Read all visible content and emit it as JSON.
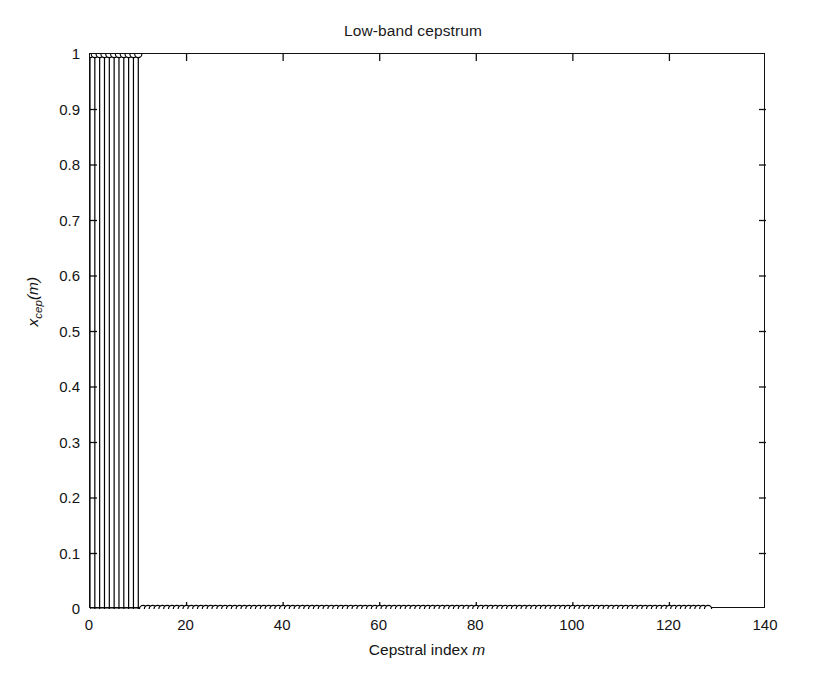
{
  "chart_data": {
    "type": "bar",
    "plot_style": "stem",
    "title": "Low-band cepstrum",
    "xlabel": "Cepstral index m",
    "xlabel_plain": "Cepstral index",
    "xlabel_italic_var": "m",
    "ylabel": "x_cep(m)",
    "ylabel_base": "x",
    "ylabel_sub": "cep",
    "ylabel_tail": "(m)",
    "xlim": [
      0,
      140
    ],
    "ylim": [
      0,
      1
    ],
    "grid": false,
    "legend": null,
    "xticks": [
      0,
      20,
      40,
      60,
      80,
      100,
      120,
      140
    ],
    "xticklabels": [
      "0",
      "20",
      "40",
      "60",
      "80",
      "100",
      "120",
      "140"
    ],
    "yticks": [
      0,
      0.1,
      0.2,
      0.3,
      0.4,
      0.5,
      0.6,
      0.7,
      0.8,
      0.9,
      1
    ],
    "yticklabels": [
      "0",
      "0.1",
      "0.2",
      "0.3",
      "0.4",
      "0.5",
      "0.6",
      "0.7",
      "0.8",
      "0.9",
      "1"
    ],
    "marker": "circle-open",
    "line_color": "#000000",
    "series_name": "low-band lifter",
    "x": [
      0,
      1,
      2,
      3,
      4,
      5,
      6,
      7,
      8,
      9,
      10,
      11,
      12,
      13,
      14,
      15,
      16,
      17,
      18,
      19,
      20,
      21,
      22,
      23,
      24,
      25,
      26,
      27,
      28,
      29,
      30,
      31,
      32,
      33,
      34,
      35,
      36,
      37,
      38,
      39,
      40,
      41,
      42,
      43,
      44,
      45,
      46,
      47,
      48,
      49,
      50,
      51,
      52,
      53,
      54,
      55,
      56,
      57,
      58,
      59,
      60,
      61,
      62,
      63,
      64,
      65,
      66,
      67,
      68,
      69,
      70,
      71,
      72,
      73,
      74,
      75,
      76,
      77,
      78,
      79,
      80,
      81,
      82,
      83,
      84,
      85,
      86,
      87,
      88,
      89,
      90,
      91,
      92,
      93,
      94,
      95,
      96,
      97,
      98,
      99,
      100,
      101,
      102,
      103,
      104,
      105,
      106,
      107,
      108,
      109,
      110,
      111,
      112,
      113,
      114,
      115,
      116,
      117,
      118,
      119,
      120,
      121,
      122,
      123,
      124,
      125,
      126,
      127,
      128
    ],
    "values": [
      1,
      1,
      1,
      1,
      1,
      1,
      1,
      1,
      1,
      1,
      1,
      0,
      0,
      0,
      0,
      0,
      0,
      0,
      0,
      0,
      0,
      0,
      0,
      0,
      0,
      0,
      0,
      0,
      0,
      0,
      0,
      0,
      0,
      0,
      0,
      0,
      0,
      0,
      0,
      0,
      0,
      0,
      0,
      0,
      0,
      0,
      0,
      0,
      0,
      0,
      0,
      0,
      0,
      0,
      0,
      0,
      0,
      0,
      0,
      0,
      0,
      0,
      0,
      0,
      0,
      0,
      0,
      0,
      0,
      0,
      0,
      0,
      0,
      0,
      0,
      0,
      0,
      0,
      0,
      0,
      0,
      0,
      0,
      0,
      0,
      0,
      0,
      0,
      0,
      0,
      0,
      0,
      0,
      0,
      0,
      0,
      0,
      0,
      0,
      0,
      0,
      0,
      0,
      0,
      0,
      0,
      0,
      0,
      0,
      0,
      0,
      0,
      0,
      0,
      0,
      0,
      0,
      0,
      0,
      0,
      0,
      0,
      0,
      0,
      0,
      0,
      0,
      0,
      0
    ]
  }
}
